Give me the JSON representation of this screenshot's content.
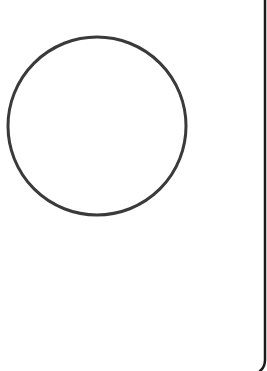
{
  "canvas": {
    "width": 267,
    "height": 371,
    "background": "#ffffff"
  },
  "shapes": {
    "circle": {
      "cx": 97,
      "cy": 126,
      "r": 89,
      "stroke": "#3a3a3a",
      "stroke_width": 3,
      "fill": "none"
    },
    "right_edge": {
      "x": 265,
      "top": 0,
      "bottom": 365,
      "stroke": "#1a1a1a",
      "stroke_width": 2.5
    }
  }
}
